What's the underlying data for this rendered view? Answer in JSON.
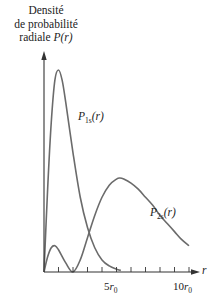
{
  "chart_data": {
    "type": "line",
    "title": "",
    "ylabel_lines": [
      "Densité",
      "de probabilité",
      "radiale P(r)"
    ],
    "ylabel": {
      "line1": "Densité",
      "line2": "de probabilité",
      "line3_text": "radiale ",
      "line3_func": "P(r)"
    },
    "xlabel": "r",
    "x_unit": "r0",
    "xlim": [
      0,
      10.5
    ],
    "ylim": [
      0,
      1.0
    ],
    "x_ticks": [
      1,
      2,
      3,
      4,
      5,
      6,
      7,
      8,
      9,
      10
    ],
    "x_tick_labels": [
      {
        "x": 5,
        "num": "5",
        "sym": "r",
        "sub": "0"
      },
      {
        "x": 10,
        "num": "10",
        "sym": "r",
        "sub": "0"
      }
    ],
    "grid": false,
    "legend_position": "inline",
    "series": [
      {
        "name": "P1s(r)",
        "label_main": "P",
        "label_sub": "1s",
        "label_arg": "(r)",
        "color": "#6b6b6b",
        "x": [
          0,
          0.25,
          0.5,
          0.75,
          1.0,
          1.25,
          1.5,
          2.0,
          2.5,
          3.0,
          3.5,
          4.0,
          4.5,
          5.0,
          5.3
        ],
        "values": [
          0,
          0.41,
          0.74,
          0.95,
          1.0,
          0.95,
          0.84,
          0.59,
          0.37,
          0.22,
          0.12,
          0.06,
          0.03,
          0.014,
          0.008
        ]
      },
      {
        "name": "P2s(r)",
        "label_main": "P",
        "label_sub": "2s",
        "label_arg": "(r)",
        "color": "#6b6b6b",
        "x": [
          0,
          0.25,
          0.5,
          0.76,
          1.0,
          1.5,
          2.0,
          2.5,
          3.0,
          3.5,
          4.0,
          4.5,
          5.0,
          5.24,
          5.5,
          6.0,
          6.5,
          7.0,
          7.5,
          8.0,
          8.5,
          9.0,
          9.5,
          10.0
        ],
        "values": [
          0,
          0.075,
          0.12,
          0.13,
          0.11,
          0.045,
          0,
          0.06,
          0.17,
          0.28,
          0.37,
          0.43,
          0.46,
          0.465,
          0.46,
          0.44,
          0.41,
          0.37,
          0.33,
          0.28,
          0.24,
          0.2,
          0.16,
          0.13
        ]
      }
    ]
  }
}
